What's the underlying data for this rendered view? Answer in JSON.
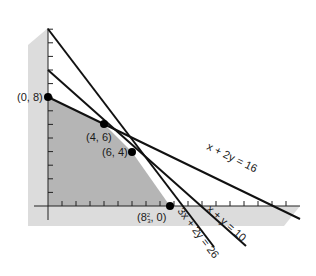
{
  "figure": {
    "colors": {
      "background": "#ffffff",
      "band": "#d9d9d9",
      "feasible_region": "#b3b3b3",
      "line": "#111111",
      "point": "#000000"
    }
  },
  "axes": {
    "x_ticks": 18,
    "y_ticks": 13
  },
  "lines": [
    {
      "id": "line-3x-2y-26",
      "equation": "3x + 2y = 26",
      "label": "3x + 2y = 26"
    },
    {
      "id": "line-x-y-10",
      "equation": "x + y = 10",
      "label": "x + y = 10"
    },
    {
      "id": "line-x-2y-16",
      "equation": "x + 2y = 16",
      "label": "x + 2y = 16"
    }
  ],
  "vertices": [
    {
      "id": "vertex-0-8",
      "label": "(0, 8)",
      "x": 0,
      "y": 8
    },
    {
      "id": "vertex-4-6",
      "label": "(4, 6)",
      "x": 4,
      "y": 6
    },
    {
      "id": "vertex-6-4",
      "label": "(6, 4)",
      "x": 6,
      "y": 4
    },
    {
      "id": "vertex-8-2-3-0",
      "label_main": "(8",
      "label_frac": "2",
      "label_den": "3",
      "label_end": ", 0)",
      "x": 8.667,
      "y": 0
    }
  ]
}
